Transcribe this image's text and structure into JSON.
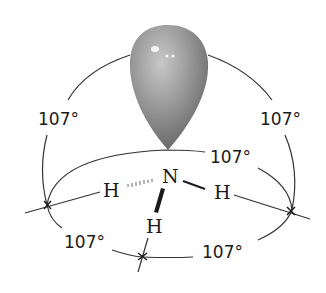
{
  "diagram": {
    "molecule": "NH3",
    "central_atom": "N",
    "hydrogens": [
      "H",
      "H",
      "H"
    ],
    "lone_pair_orbital": {
      "dots": 2,
      "color": "#8a8a8a"
    },
    "angles": [
      {
        "id": "lone-pair-left",
        "label": "107°"
      },
      {
        "id": "lone-pair-right",
        "label": "107°"
      },
      {
        "id": "h-h-back",
        "label": "107°"
      },
      {
        "id": "h-h-front-left",
        "label": "107°"
      },
      {
        "id": "h-h-front-right",
        "label": "107°"
      }
    ],
    "colors": {
      "line": "#333333",
      "text": "#1a1a1a",
      "orbital_dark": "#6e6e6e",
      "orbital_light": "#b5b5b5"
    }
  }
}
